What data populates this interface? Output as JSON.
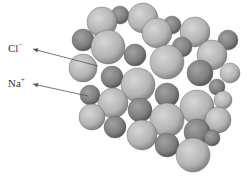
{
  "diagram": {
    "labels": [
      {
        "id": "cl",
        "symbol": "Cl",
        "charge": "−",
        "x": 8,
        "y": 43,
        "arrow_to": [
          98,
          66
        ]
      },
      {
        "id": "na",
        "symbol": "Na",
        "charge": "+",
        "x": 8,
        "y": 78,
        "arrow_to": [
          88,
          96
        ]
      }
    ],
    "watermark": "",
    "colors": {
      "cl_sphere": "#bdbdbd",
      "na_sphere": "#7f7f7f",
      "arrow": "#555555",
      "background": "#ffffff"
    },
    "spheres": [
      {
        "x": 102,
        "y": 22,
        "r": 15,
        "type": "cl"
      },
      {
        "x": 143,
        "y": 18,
        "r": 15,
        "type": "cl"
      },
      {
        "x": 120,
        "y": 15,
        "r": 9,
        "type": "na"
      },
      {
        "x": 172,
        "y": 25,
        "r": 9,
        "type": "na"
      },
      {
        "x": 195,
        "y": 32,
        "r": 15,
        "type": "cl"
      },
      {
        "x": 228,
        "y": 40,
        "r": 10,
        "type": "na"
      },
      {
        "x": 83,
        "y": 40,
        "r": 11,
        "type": "na"
      },
      {
        "x": 157,
        "y": 33,
        "r": 15,
        "type": "cl"
      },
      {
        "x": 108,
        "y": 47,
        "r": 17,
        "type": "cl"
      },
      {
        "x": 135,
        "y": 55,
        "r": 11,
        "type": "na"
      },
      {
        "x": 182,
        "y": 47,
        "r": 10,
        "type": "na"
      },
      {
        "x": 212,
        "y": 55,
        "r": 15,
        "type": "cl"
      },
      {
        "x": 167,
        "y": 62,
        "r": 17,
        "type": "cl"
      },
      {
        "x": 83,
        "y": 68,
        "r": 14,
        "type": "cl"
      },
      {
        "x": 230,
        "y": 73,
        "r": 10,
        "type": "cl"
      },
      {
        "x": 200,
        "y": 73,
        "r": 13,
        "type": "na"
      },
      {
        "x": 112,
        "y": 77,
        "r": 11,
        "type": "na"
      },
      {
        "x": 138,
        "y": 85,
        "r": 17,
        "type": "cl"
      },
      {
        "x": 217,
        "y": 87,
        "r": 8,
        "type": "na"
      },
      {
        "x": 167,
        "y": 95,
        "r": 12,
        "type": "na"
      },
      {
        "x": 90,
        "y": 95,
        "r": 10,
        "type": "na"
      },
      {
        "x": 223,
        "y": 100,
        "r": 9,
        "type": "cl"
      },
      {
        "x": 113,
        "y": 103,
        "r": 15,
        "type": "cl"
      },
      {
        "x": 197,
        "y": 107,
        "r": 17,
        "type": "cl"
      },
      {
        "x": 140,
        "y": 110,
        "r": 12,
        "type": "na"
      },
      {
        "x": 218,
        "y": 120,
        "r": 13,
        "type": "cl"
      },
      {
        "x": 92,
        "y": 117,
        "r": 13,
        "type": "cl"
      },
      {
        "x": 167,
        "y": 120,
        "r": 17,
        "type": "cl"
      },
      {
        "x": 115,
        "y": 127,
        "r": 11,
        "type": "na"
      },
      {
        "x": 212,
        "y": 138,
        "r": 8,
        "type": "na"
      },
      {
        "x": 197,
        "y": 132,
        "r": 13,
        "type": "na"
      },
      {
        "x": 142,
        "y": 135,
        "r": 15,
        "type": "cl"
      },
      {
        "x": 167,
        "y": 145,
        "r": 12,
        "type": "na"
      },
      {
        "x": 193,
        "y": 155,
        "r": 17,
        "type": "cl"
      }
    ]
  }
}
